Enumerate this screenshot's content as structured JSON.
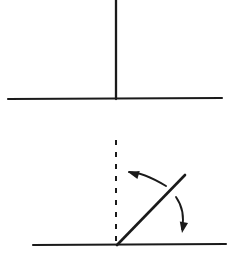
{
  "figure": {
    "title": "Rod tilting from vertical to inclined position",
    "background_color": "#ffffff",
    "ink_color": "#1a1a1a",
    "width": 233,
    "height": 256,
    "style": "hand-drawn line diagram",
    "panels": [
      {
        "name": "upper-panel",
        "description": "Rod standing vertically on a horizontal ground line",
        "elements": [
          "ground-line",
          "vertical-rod"
        ]
      },
      {
        "name": "lower-panel",
        "description": "Rod tilted about 45 degrees to the right of vertical, with dashed reference vertical and two curved motion arrows",
        "elements": [
          "ground-line",
          "dashed-vertical-reference",
          "tilted-rod",
          "rotation-arrow-left",
          "fall-arrow-down"
        ]
      }
    ]
  },
  "chart_data": {
    "type": "diagram",
    "title": "Rod tilting from vertical to inclined position",
    "xlabel": "",
    "ylabel": "",
    "grid": false,
    "legend": "none",
    "xlim": [
      0,
      233
    ],
    "ylim": [
      0,
      256
    ],
    "shapes": [
      {
        "id": "upper-ground-line",
        "kind": "line",
        "label": "ground line (upper panel)",
        "x1": 8,
        "y1": 99,
        "x2": 222,
        "y2": 98,
        "stroke": "#1a1a1a",
        "stroke_width": 2.1,
        "dash": "solid"
      },
      {
        "id": "vertical-rod",
        "kind": "line",
        "label": "vertical rod",
        "x1": 116,
        "y1": 0,
        "x2": 116,
        "y2": 99,
        "stroke": "#1a1a1a",
        "stroke_width": 2.3,
        "dash": "solid"
      },
      {
        "id": "lower-ground-line",
        "kind": "line",
        "label": "ground line (lower panel)",
        "x1": 33,
        "y1": 245,
        "x2": 226,
        "y2": 244,
        "stroke": "#1a1a1a",
        "stroke_width": 2.1,
        "dash": "solid"
      },
      {
        "id": "dashed-vertical-reference",
        "kind": "line",
        "label": "dashed vertical reference",
        "x1": 116,
        "y1": 140,
        "x2": 116,
        "y2": 245,
        "stroke": "#1a1a1a",
        "stroke_width": 2.0,
        "dash": "5 7"
      },
      {
        "id": "tilted-rod",
        "kind": "line",
        "label": "tilted rod at about 45 degrees",
        "x1": 117,
        "y1": 245,
        "x2": 185,
        "y2": 175,
        "stroke": "#1a1a1a",
        "stroke_width": 2.6,
        "dash": "solid",
        "angle_from_vertical_deg": 45
      },
      {
        "id": "rotation-arrow-left",
        "kind": "curved-arrow",
        "label": "curved arrow pointing left toward vertical",
        "path": "M 166,186 C 156,180 140,172 129,172",
        "tip": [
          128,
          172
        ],
        "direction": "left",
        "stroke": "#1a1a1a",
        "stroke_width": 1.9
      },
      {
        "id": "fall-arrow-down",
        "kind": "curved-arrow",
        "label": "curved arrow pointing down along fall direction",
        "path": "M 176,197 C 183,207 184,219 182,229",
        "tip": [
          182,
          233
        ],
        "direction": "down",
        "stroke": "#1a1a1a",
        "stroke_width": 1.9
      }
    ],
    "annotations": []
  }
}
